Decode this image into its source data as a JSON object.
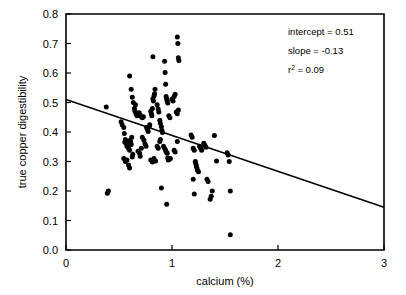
{
  "chart_data": {
    "type": "scatter",
    "title": "",
    "xlabel": "calcium (%)",
    "ylabel": "true copper digestibility",
    "xlim": [
      0,
      3
    ],
    "ylim": [
      0.0,
      0.8
    ],
    "xticks": [
      0,
      1,
      2,
      3
    ],
    "xtick_labels": [
      "0",
      "1",
      "2",
      "3"
    ],
    "yticks": [
      0.0,
      0.1,
      0.2,
      0.3,
      0.4,
      0.5,
      0.6,
      0.7,
      0.8
    ],
    "ytick_labels": [
      "0.0",
      "0.1",
      "0.2",
      "0.3",
      "0.4",
      "0.5",
      "0.6",
      "0.7",
      "0.8"
    ],
    "grid": false,
    "legend": null,
    "marker": "filled-circle",
    "marker_color": "#000000",
    "fit_line": {
      "type": "linear-regression",
      "intercept": 0.51,
      "slope": -0.13,
      "r_squared": 0.09,
      "x_start": 0,
      "y_start": 0.51,
      "x_end": 3,
      "y_end": 0.145,
      "color": "#000000"
    },
    "annotations": [
      {
        "text": "intercept = 0.51"
      },
      {
        "text": "slope = -0.13"
      },
      {
        "text": "r",
        "sup": "2",
        "rest": " = 0.09"
      }
    ],
    "points": [
      [
        0.38,
        0.485
      ],
      [
        0.4,
        0.2
      ],
      [
        0.39,
        0.192
      ],
      [
        0.52,
        0.435
      ],
      [
        0.53,
        0.425
      ],
      [
        0.545,
        0.415
      ],
      [
        0.55,
        0.395
      ],
      [
        0.56,
        0.375
      ],
      [
        0.555,
        0.365
      ],
      [
        0.57,
        0.36
      ],
      [
        0.575,
        0.352
      ],
      [
        0.585,
        0.368
      ],
      [
        0.59,
        0.345
      ],
      [
        0.6,
        0.338
      ],
      [
        0.605,
        0.372
      ],
      [
        0.61,
        0.365
      ],
      [
        0.615,
        0.358
      ],
      [
        0.62,
        0.382
      ],
      [
        0.545,
        0.31
      ],
      [
        0.56,
        0.3
      ],
      [
        0.575,
        0.305
      ],
      [
        0.59,
        0.288
      ],
      [
        0.6,
        0.278
      ],
      [
        0.625,
        0.315
      ],
      [
        0.63,
        0.325
      ],
      [
        0.645,
        0.48
      ],
      [
        0.65,
        0.47
      ],
      [
        0.66,
        0.462
      ],
      [
        0.67,
        0.455
      ],
      [
        0.655,
        0.492
      ],
      [
        0.6,
        0.59
      ],
      [
        0.615,
        0.545
      ],
      [
        0.625,
        0.518
      ],
      [
        0.635,
        0.5
      ],
      [
        0.69,
        0.465
      ],
      [
        0.7,
        0.458
      ],
      [
        0.71,
        0.452
      ],
      [
        0.72,
        0.448
      ],
      [
        0.73,
        0.452
      ],
      [
        0.68,
        0.335
      ],
      [
        0.695,
        0.328
      ],
      [
        0.7,
        0.318
      ],
      [
        0.71,
        0.345
      ],
      [
        0.72,
        0.382
      ],
      [
        0.735,
        0.372
      ],
      [
        0.745,
        0.36
      ],
      [
        0.755,
        0.352
      ],
      [
        0.76,
        0.415
      ],
      [
        0.77,
        0.408
      ],
      [
        0.775,
        0.402
      ],
      [
        0.785,
        0.418
      ],
      [
        0.79,
        0.425
      ],
      [
        0.8,
        0.47
      ],
      [
        0.805,
        0.462
      ],
      [
        0.81,
        0.455
      ],
      [
        0.815,
        0.48
      ],
      [
        0.82,
        0.512
      ],
      [
        0.825,
        0.505
      ],
      [
        0.83,
        0.522
      ],
      [
        0.835,
        0.53
      ],
      [
        0.84,
        0.545
      ],
      [
        0.82,
        0.655
      ],
      [
        0.86,
        0.492
      ],
      [
        0.87,
        0.478
      ],
      [
        0.875,
        0.468
      ],
      [
        0.885,
        0.44
      ],
      [
        0.89,
        0.43
      ],
      [
        0.9,
        0.418
      ],
      [
        0.905,
        0.405
      ],
      [
        0.91,
        0.398
      ],
      [
        0.8,
        0.305
      ],
      [
        0.815,
        0.298
      ],
      [
        0.83,
        0.31
      ],
      [
        0.845,
        0.302
      ],
      [
        0.86,
        0.352
      ],
      [
        0.87,
        0.345
      ],
      [
        0.885,
        0.368
      ],
      [
        0.89,
        0.375
      ],
      [
        0.92,
        0.352
      ],
      [
        0.93,
        0.345
      ],
      [
        0.94,
        0.338
      ],
      [
        0.945,
        0.332
      ],
      [
        0.955,
        0.328
      ],
      [
        0.96,
        0.312
      ],
      [
        0.965,
        0.305
      ],
      [
        0.975,
        0.308
      ],
      [
        0.985,
        0.31
      ],
      [
        0.93,
        0.64
      ],
      [
        0.935,
        0.602
      ],
      [
        0.94,
        0.562
      ],
      [
        0.945,
        0.52
      ],
      [
        0.95,
        0.512
      ],
      [
        0.955,
        0.505
      ],
      [
        0.96,
        0.498
      ],
      [
        0.97,
        0.455
      ],
      [
        0.98,
        0.448
      ],
      [
        1.0,
        0.512
      ],
      [
        1.01,
        0.505
      ],
      [
        1.02,
        0.52
      ],
      [
        1.03,
        0.528
      ],
      [
        1.04,
        0.468
      ],
      [
        1.05,
        0.462
      ],
      [
        1.06,
        0.475
      ],
      [
        1.05,
        0.722
      ],
      [
        1.055,
        0.7
      ],
      [
        1.06,
        0.652
      ],
      [
        1.065,
        0.642
      ],
      [
        1.02,
        0.338
      ],
      [
        1.03,
        0.332
      ],
      [
        1.05,
        0.368
      ],
      [
        0.9,
        0.21
      ],
      [
        0.95,
        0.155
      ],
      [
        1.18,
        0.39
      ],
      [
        1.19,
        0.382
      ],
      [
        1.2,
        0.345
      ],
      [
        1.21,
        0.338
      ],
      [
        1.22,
        0.3
      ],
      [
        1.225,
        0.292
      ],
      [
        1.23,
        0.285
      ],
      [
        1.235,
        0.278
      ],
      [
        1.24,
        0.27
      ],
      [
        1.25,
        0.265
      ],
      [
        1.26,
        0.352
      ],
      [
        1.27,
        0.345
      ],
      [
        1.28,
        0.338
      ],
      [
        1.3,
        0.362
      ],
      [
        1.31,
        0.355
      ],
      [
        1.32,
        0.348
      ],
      [
        1.33,
        0.24
      ],
      [
        1.34,
        0.232
      ],
      [
        1.2,
        0.24
      ],
      [
        1.21,
        0.19
      ],
      [
        1.36,
        0.172
      ],
      [
        1.37,
        0.182
      ],
      [
        1.38,
        0.2
      ],
      [
        1.4,
        0.388
      ],
      [
        1.42,
        0.302
      ],
      [
        1.52,
        0.33
      ],
      [
        1.53,
        0.322
      ],
      [
        1.54,
        0.3
      ],
      [
        1.55,
        0.2
      ],
      [
        1.55,
        0.052
      ]
    ]
  },
  "figure": {
    "background": "#ffffff",
    "axis_color": "#000000"
  }
}
